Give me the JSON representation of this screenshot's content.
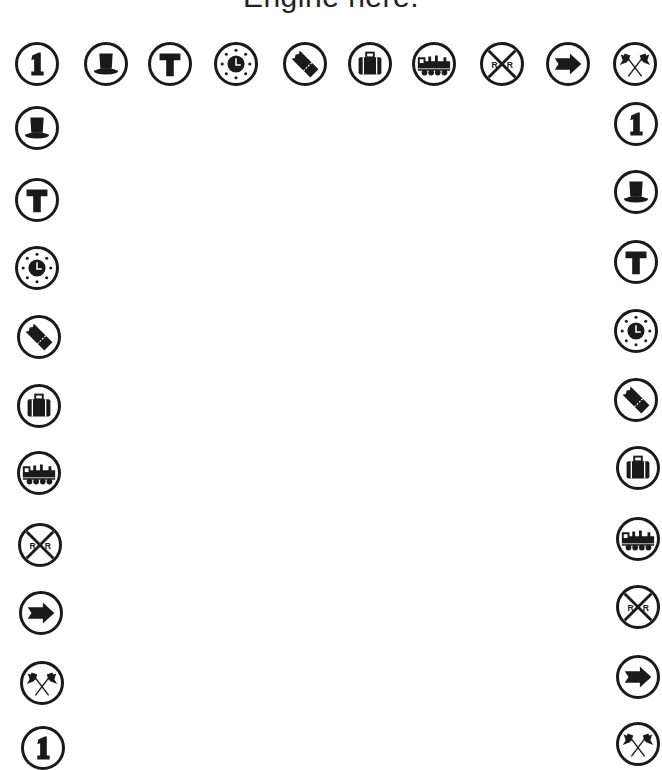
{
  "title": "Engine here.",
  "colors": {
    "ink": "#1a1a1a",
    "background": "#ffffff"
  },
  "top_row": [
    {
      "icon": "number-one-icon",
      "x": 15,
      "y": 42
    },
    {
      "icon": "top-hat-icon",
      "x": 84,
      "y": 42
    },
    {
      "icon": "letter-t-icon",
      "x": 148,
      "y": 42
    },
    {
      "icon": "clock-icon",
      "x": 214,
      "y": 42
    },
    {
      "icon": "ticket-icon",
      "x": 283,
      "y": 42
    },
    {
      "icon": "suitcase-icon",
      "x": 348,
      "y": 42
    },
    {
      "icon": "locomotive-icon",
      "x": 412,
      "y": 42
    },
    {
      "icon": "railroad-crossing-icon",
      "x": 480,
      "y": 42
    },
    {
      "icon": "arrow-right-icon",
      "x": 546,
      "y": 42
    },
    {
      "icon": "crossed-flags-icon",
      "x": 613,
      "y": 42
    }
  ],
  "left_column": [
    {
      "icon": "top-hat-icon",
      "x": 15,
      "y": 106
    },
    {
      "icon": "letter-t-icon",
      "x": 15,
      "y": 178
    },
    {
      "icon": "clock-icon",
      "x": 15,
      "y": 246
    },
    {
      "icon": "ticket-icon",
      "x": 17,
      "y": 315
    },
    {
      "icon": "suitcase-icon",
      "x": 17,
      "y": 384
    },
    {
      "icon": "locomotive-icon",
      "x": 17,
      "y": 451
    },
    {
      "icon": "railroad-crossing-icon",
      "x": 18,
      "y": 523
    },
    {
      "icon": "arrow-right-icon",
      "x": 19,
      "y": 591
    },
    {
      "icon": "crossed-flags-icon",
      "x": 20,
      "y": 661
    },
    {
      "icon": "number-one-icon",
      "x": 21,
      "y": 726
    }
  ],
  "right_column": [
    {
      "icon": "number-one-icon",
      "x": 614,
      "y": 102
    },
    {
      "icon": "top-hat-icon",
      "x": 614,
      "y": 170
    },
    {
      "icon": "letter-t-icon",
      "x": 614,
      "y": 240
    },
    {
      "icon": "clock-icon",
      "x": 614,
      "y": 309
    },
    {
      "icon": "ticket-icon",
      "x": 614,
      "y": 378
    },
    {
      "icon": "suitcase-icon",
      "x": 616,
      "y": 446
    },
    {
      "icon": "locomotive-icon",
      "x": 616,
      "y": 517
    },
    {
      "icon": "railroad-crossing-icon",
      "x": 616,
      "y": 585
    },
    {
      "icon": "arrow-right-icon",
      "x": 616,
      "y": 655
    },
    {
      "icon": "crossed-flags-icon",
      "x": 616,
      "y": 722
    }
  ]
}
